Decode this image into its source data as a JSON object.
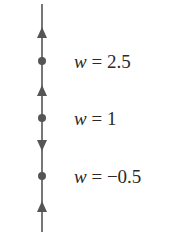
{
  "diagram": {
    "type": "phase-line",
    "line_color": "#555555",
    "equilibria": [
      {
        "value": "2.5",
        "label_var": "w",
        "label_eq": " = ",
        "label_value": "2.5"
      },
      {
        "value": "1",
        "label_var": "w",
        "label_eq": " = ",
        "label_value": "1"
      },
      {
        "value": "-0.5",
        "label_var": "w",
        "label_eq": " = ",
        "label_value": "−0.5"
      }
    ],
    "arrows": [
      {
        "region": "above 2.5",
        "direction": "up"
      },
      {
        "region": "between 1 and 2.5",
        "direction": "up"
      },
      {
        "region": "between -0.5 and 1",
        "direction": "down"
      },
      {
        "region": "below -0.5",
        "direction": "up"
      }
    ]
  }
}
